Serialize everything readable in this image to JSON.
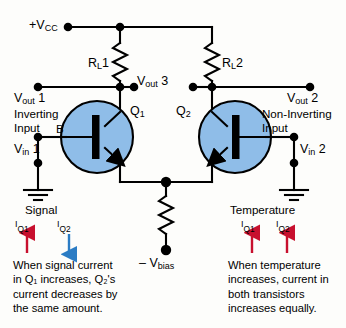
{
  "diagram": {
    "colors": {
      "transistor_fill": "#8fbde8",
      "wire": "#000000",
      "arrow_increase": "#c8102e",
      "arrow_decrease": "#2b7cc4",
      "background": "#fdfdfb"
    },
    "supply": {
      "vcc_label": "+V",
      "vcc_sub": "CC",
      "vbias_label": "– V",
      "vbias_sub": "bias"
    },
    "resistors": [
      {
        "name": "R",
        "sub": "L",
        "index": "1"
      },
      {
        "name": "R",
        "sub": "L",
        "index": "2"
      }
    ],
    "transistors": [
      {
        "name": "Q",
        "sub": "1"
      },
      {
        "name": "Q",
        "sub": "2"
      }
    ],
    "base_terminal_label": "B",
    "outputs": [
      {
        "name": "V",
        "sub": "out",
        "index": "1"
      },
      {
        "name": "V",
        "sub": "out",
        "index": "3"
      },
      {
        "name": "V",
        "sub": "out",
        "index": "2"
      }
    ],
    "inputs": [
      {
        "mode": "Inverting",
        "mode_line2": "Input",
        "name": "V",
        "sub": "in",
        "index": "1"
      },
      {
        "mode": "Non-Inverting",
        "mode_line2": "Input",
        "name": "V",
        "sub": "in",
        "index": "2"
      }
    ]
  },
  "annotations": {
    "left": {
      "heading": "Signal",
      "currents": [
        {
          "name": "I",
          "sub": "Q1",
          "direction": "up",
          "color": "#c8102e"
        },
        {
          "name": "I",
          "sub": "Q2",
          "direction": "down",
          "color": "#2b7cc4"
        }
      ],
      "lines": [
        "When signal current",
        "in Q₁ increases, Q₂'s",
        "current decreases by",
        "the same amount."
      ]
    },
    "right": {
      "heading": "Temperature",
      "currents": [
        {
          "name": "I",
          "sub": "Q1",
          "direction": "up",
          "color": "#c8102e"
        },
        {
          "name": "I",
          "sub": "Q2",
          "direction": "up",
          "color": "#c8102e"
        }
      ],
      "lines": [
        "When temperature",
        "increases, current in",
        "both transistors",
        "increases equally."
      ]
    }
  }
}
